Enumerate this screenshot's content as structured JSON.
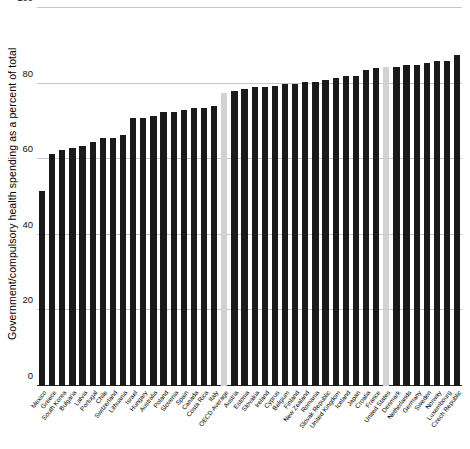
{
  "chart_data": {
    "type": "bar",
    "title": "",
    "xlabel": "",
    "ylabel": "Government/compulsory health spending as a percent of total",
    "ylim": [
      0,
      100
    ],
    "yticks": [
      0,
      20,
      40,
      60,
      80,
      100
    ],
    "grid": true,
    "legend": null,
    "highlight_color": "#d2d2d2",
    "bar_color": "#1a1a1a",
    "highlighted_categories": [
      "OECD Average",
      "United States"
    ],
    "categories": [
      "Mexico",
      "Greece",
      "South Korea",
      "Bulgaria",
      "Latvia",
      "Portugal",
      "Chile",
      "Switzerland",
      "Lithuania",
      "Israel",
      "Hungary",
      "Australia",
      "Poland",
      "Slovenia",
      "Spain",
      "Canada",
      "Costa Rica",
      "Italy",
      "OECD Average",
      "Austria",
      "Estonia",
      "Slovakia",
      "Ireland",
      "Cyprus",
      "Belgium",
      "Finland",
      "New Zealand",
      "Romania",
      "Slovak Republic",
      "United Kingdom",
      "Iceland",
      "Japan",
      "Croatia",
      "France",
      "United States",
      "Denmark",
      "Netherlands",
      "Germany",
      "Sweden",
      "Norway",
      "Luxembourg",
      "Czech Republic"
    ],
    "values": [
      51.5,
      61.5,
      62.5,
      63.0,
      63.5,
      64.5,
      65.5,
      65.5,
      66.5,
      71.0,
      71.0,
      71.5,
      72.5,
      72.5,
      73.0,
      73.5,
      73.5,
      74.0,
      77.5,
      78.0,
      78.5,
      79.0,
      79.0,
      79.5,
      80.0,
      80.0,
      80.5,
      80.5,
      81.0,
      81.5,
      82.0,
      82.0,
      83.5,
      84.0,
      84.5,
      84.5,
      85.0,
      85.0,
      85.5,
      86.0,
      86.0,
      87.5
    ]
  }
}
